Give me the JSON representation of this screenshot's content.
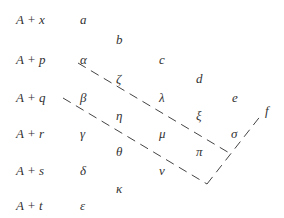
{
  "rows": [
    {
      "label": "A + x"
    },
    {
      "label": "A + p"
    },
    {
      "label": "A + q"
    },
    {
      "label": "A + r"
    },
    {
      "label": "A + s"
    },
    {
      "label": "A + t"
    }
  ],
  "symbols": {
    "a": "a",
    "b": "b",
    "c": "c",
    "d": "d",
    "e": "e",
    "f": "f",
    "alpha": "α",
    "beta": "β",
    "gamma": "γ",
    "delta": "δ",
    "epsilon": "ε",
    "zeta": "ζ",
    "eta": "η",
    "theta": "θ",
    "kappa": "κ",
    "lambda": "λ",
    "mu": "μ",
    "nu": "ν",
    "xi": "ξ",
    "pi": "π",
    "sigma": "σ"
  },
  "colors": {
    "text": "#333333",
    "dash": "#444444",
    "background": "#ffffff"
  }
}
